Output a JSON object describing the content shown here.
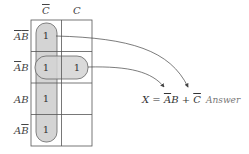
{
  "diagram": {
    "type": "karnaugh-map",
    "columns": [
      {
        "label": "C",
        "complemented": true
      },
      {
        "label": "C",
        "complemented": false
      }
    ],
    "rows": [
      {
        "label_a": "A",
        "a_bar": true,
        "label_b": "B",
        "b_bar": true
      },
      {
        "label_a": "A",
        "a_bar": true,
        "label_b": "B",
        "b_bar": false
      },
      {
        "label_a": "A",
        "a_bar": false,
        "label_b": "B",
        "b_bar": false
      },
      {
        "label_a": "A",
        "a_bar": false,
        "label_b": "B",
        "b_bar": true
      }
    ],
    "cells": [
      [
        "1",
        ""
      ],
      [
        "1",
        "1"
      ],
      [
        "1",
        ""
      ],
      [
        "1",
        ""
      ]
    ],
    "groups": [
      {
        "name": "vertical-group",
        "term": "C̄"
      },
      {
        "name": "horizontal-group",
        "term": "ĀB"
      }
    ],
    "equation": {
      "lhs": "X",
      "eq": "=",
      "term1_a": "A",
      "term1_b": "B",
      "plus": "+",
      "term2": "C"
    },
    "answer_label": "Answer",
    "colors": {
      "grid": "#555555",
      "group_fill": "#d4d4d4",
      "group_stroke": "#666666",
      "arrow": "#444444"
    }
  }
}
